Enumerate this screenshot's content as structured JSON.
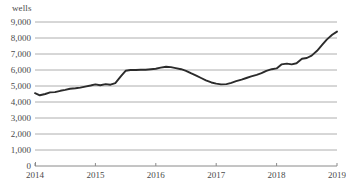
{
  "chart_data": {
    "type": "line",
    "title": "",
    "subtitle": "",
    "xlabel": "",
    "ylabel": "wells",
    "unit_label": "wells",
    "legend": [],
    "legend_position": "none",
    "grid": true,
    "grid_axis": "y",
    "xlim": [
      2014,
      2019
    ],
    "ylim": [
      0,
      9000
    ],
    "ytick_labels": [
      "9,000",
      "8,000",
      "7,000",
      "6,000",
      "5,000",
      "4,000",
      "3,000",
      "2,000",
      "1,000",
      "0"
    ],
    "ytick_values": [
      9000,
      8000,
      7000,
      6000,
      5000,
      4000,
      3000,
      2000,
      1000,
      0
    ],
    "xtick_labels": [
      "2014",
      "2015",
      "2016",
      "2017",
      "2018",
      "2019"
    ],
    "xtick_values": [
      2014,
      2015,
      2016,
      2017,
      2018,
      2019
    ],
    "series": [
      {
        "name": "wells",
        "color": "#2b2b2b",
        "x": [
          2014.0,
          2014.08,
          2014.17,
          2014.25,
          2014.33,
          2014.42,
          2014.5,
          2014.58,
          2014.67,
          2014.75,
          2014.83,
          2014.92,
          2015.0,
          2015.08,
          2015.17,
          2015.25,
          2015.33,
          2015.42,
          2015.5,
          2015.58,
          2015.67,
          2015.75,
          2015.83,
          2015.92,
          2016.0,
          2016.08,
          2016.17,
          2016.25,
          2016.33,
          2016.42,
          2016.5,
          2016.58,
          2016.67,
          2016.75,
          2016.83,
          2016.92,
          2017.0,
          2017.08,
          2017.17,
          2017.25,
          2017.33,
          2017.42,
          2017.5,
          2017.58,
          2017.67,
          2017.75,
          2017.83,
          2017.92,
          2018.0,
          2018.08,
          2018.17,
          2018.25,
          2018.33,
          2018.42,
          2018.5,
          2018.58,
          2018.67,
          2018.75,
          2018.83,
          2018.92,
          2019.0
        ],
        "values": [
          4550,
          4420,
          4500,
          4600,
          4620,
          4700,
          4760,
          4830,
          4860,
          4900,
          4960,
          5030,
          5100,
          5050,
          5120,
          5080,
          5180,
          5600,
          5950,
          6000,
          6000,
          6020,
          6020,
          6050,
          6080,
          6150,
          6200,
          6180,
          6120,
          6050,
          5950,
          5800,
          5650,
          5500,
          5350,
          5220,
          5150,
          5100,
          5120,
          5200,
          5300,
          5400,
          5500,
          5600,
          5700,
          5800,
          5950,
          6050,
          6100,
          6350,
          6400,
          6350,
          6420,
          6700,
          6750,
          6900,
          7200,
          7550,
          7900,
          8200,
          8400
        ]
      }
    ]
  },
  "plot_geometry": {
    "left": 35,
    "right": 337,
    "top": 22,
    "bottom": 166
  },
  "style": {
    "grid_color": "#aeaeae",
    "axis_color": "#8a8a8a",
    "line_color": "#2b2b2b",
    "text_color": "#4a4a4a",
    "background": "#ffffff"
  }
}
